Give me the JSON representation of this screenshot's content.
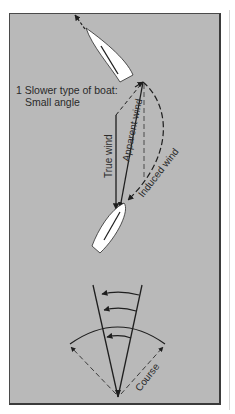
{
  "figure": {
    "caption_line1": "1 Slower type of boat:",
    "caption_line2": "Small angle",
    "labels": {
      "true_wind": "True wind",
      "apparent_wind": "Apparent wind",
      "induced_wind": "Induced wind",
      "course": "Course"
    },
    "colors": {
      "background": "#b9b9b9",
      "line": "#1e1e1e",
      "boat_fill": "#ffffff"
    }
  }
}
